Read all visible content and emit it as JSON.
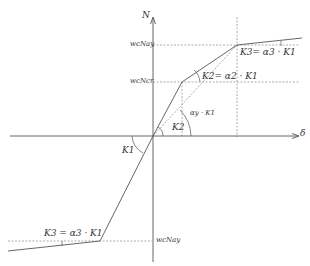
{
  "diagram": {
    "axes": {
      "y_label": "N",
      "x_label": "δ"
    },
    "levels": {
      "upper_yield": "wcNay",
      "crack": "wcNcr",
      "lower_yield": "wcNay"
    },
    "labels": {
      "k1": "K1",
      "k2": "K2",
      "alpha_y_k1": "αy · K1",
      "k2_eq": "K2= α2 · K1",
      "k3_eq_top": "K3= α3 · K1",
      "k3_eq_bottom": "K3 = α3 · K1"
    },
    "colors": {
      "line": "#555555",
      "dash": "#888888",
      "text": "#333333"
    }
  }
}
